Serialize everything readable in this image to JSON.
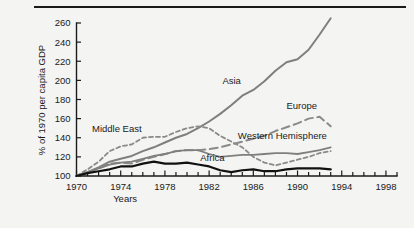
{
  "figure": {
    "background": "#f4f4f2",
    "has_top_rule": true
  },
  "chart_data": {
    "type": "line",
    "title": "",
    "xlabel": "Years",
    "ylabel": "% of 1970 per capita GDP",
    "xlim": [
      1970,
      1999
    ],
    "ylim": [
      100,
      268
    ],
    "grid": false,
    "legend_position": "inline-labels",
    "xticks_major": [
      1970,
      1974,
      1978,
      1982,
      1986,
      1990,
      1994,
      1998
    ],
    "xticks_minor_every": 1,
    "yticks": [
      100,
      120,
      140,
      160,
      180,
      200,
      220,
      240,
      260
    ],
    "x": [
      1970,
      1971,
      1972,
      1973,
      1974,
      1975,
      1976,
      1977,
      1978,
      1979,
      1980,
      1981,
      1982,
      1983,
      1984,
      1985,
      1986,
      1987,
      1988,
      1989,
      1990,
      1991,
      1992,
      1993
    ],
    "series": [
      {
        "name": "Asia",
        "label": "Asia",
        "color": "#7f7f7f",
        "style": "solid",
        "width": 2.0,
        "label_x": 1983.2,
        "label_y": 196,
        "values": [
          100,
          104,
          109,
          115,
          118,
          121,
          126,
          130,
          135,
          140,
          144,
          150,
          157,
          165,
          174,
          184,
          190,
          199,
          210,
          219,
          222,
          232,
          248,
          265
        ]
      },
      {
        "name": "Europe",
        "label": "Europe",
        "color": "#8a8a8a",
        "style": "dashed-long",
        "width": 2.0,
        "label_x": 1989.0,
        "label_y": 170,
        "values": [
          100,
          104,
          108,
          113,
          114,
          113,
          117,
          120,
          123,
          126,
          127,
          127,
          128,
          130,
          133,
          136,
          139,
          142,
          147,
          151,
          155,
          160,
          162,
          152
        ]
      },
      {
        "name": "Middle East",
        "label": "Middle East",
        "color": "#8a8a8a",
        "style": "dashed-short",
        "width": 1.8,
        "label_x": 1971.4,
        "label_y": 146,
        "values": [
          100,
          107,
          115,
          126,
          131,
          133,
          140,
          141,
          141,
          146,
          150,
          152,
          150,
          142,
          136,
          130,
          120,
          114,
          111,
          114,
          117,
          120,
          124,
          126
        ]
      },
      {
        "name": "Western Hemisphere",
        "label": "Western Hemisphere",
        "color": "#7f7f7f",
        "style": "solid",
        "width": 1.8,
        "label_x": 1984.6,
        "label_y": 139,
        "values": [
          100,
          104,
          108,
          112,
          114,
          115,
          118,
          121,
          123,
          126,
          127,
          127,
          123,
          120,
          121,
          122,
          122,
          123,
          124,
          124,
          123,
          125,
          127,
          130
        ]
      },
      {
        "name": "Africa",
        "label": "Africa",
        "color": "#111111",
        "style": "solid",
        "width": 2.2,
        "label_x": 1981.2,
        "label_y": 116,
        "values": [
          100,
          103,
          105,
          107,
          110,
          110,
          113,
          115,
          113,
          113,
          114,
          112,
          110,
          106,
          104,
          106,
          107,
          105,
          105,
          107,
          108,
          108,
          108,
          107
        ]
      }
    ]
  }
}
